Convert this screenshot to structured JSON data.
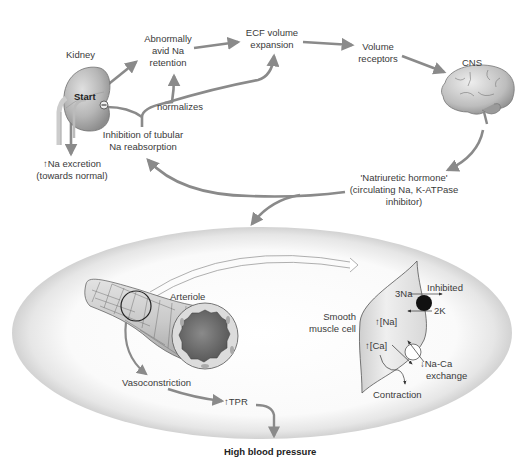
{
  "diagram": {
    "colors": {
      "arrow": "#8a8a8a",
      "text": "#3a3a3a",
      "organ_fill": "#bdbdbd",
      "ellipse_fill": "#efefef",
      "ellipse_edge": "#d4d4d4",
      "pump": "#111111",
      "lumen": "#6e6e6e"
    },
    "top_cycle": {
      "kidney_label": "Kidney",
      "start_label": "Start",
      "inhibit_sign": "−",
      "avid_retention": [
        "Abnormally",
        "avid Na",
        "retention"
      ],
      "ecf_expansion": [
        "ECF volume",
        "expansion"
      ],
      "volume_receptors": [
        "Volume",
        "receptors"
      ],
      "cns_label": "CNS",
      "natriuretic_hormone": [
        "'Natriuretic hormone'",
        "(circulating Na, K-ATPase",
        "inhibitor)"
      ],
      "inhibition_tubular": [
        "Inhibition of tubular",
        "Na reabsorption"
      ],
      "normalizes_label": "normalizes",
      "na_excretion": [
        "↑Na excretion",
        "(towards normal)"
      ]
    },
    "vascular_panel": {
      "arteriole_label": "Arteriole",
      "smooth_muscle_label": [
        "Smooth",
        "muscle cell"
      ],
      "pump_na": "3Na",
      "pump_k": "2K",
      "inhibited_label": "Inhibited",
      "na_conc": "↑[Na]",
      "ca_conc": "↑[Ca]",
      "na_ca_exchange": [
        "↓Na-Ca",
        "exchange"
      ],
      "contraction_label": "Contraction",
      "vasoconstriction_label": "Vasoconstriction",
      "tpr_label": "↑TPR"
    },
    "outcome": {
      "label": "High blood pressure"
    }
  }
}
